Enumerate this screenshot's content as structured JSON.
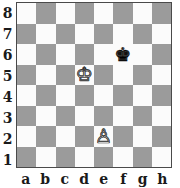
{
  "board": {
    "orientation": "white",
    "light_square_color": "#fbfbfb",
    "dark_square_color": "#9b9b9b",
    "border_color": "#4a4a4a",
    "label_color": "#1a1a1a",
    "files": [
      "a",
      "b",
      "c",
      "d",
      "e",
      "f",
      "g",
      "h"
    ],
    "ranks": [
      "8",
      "7",
      "6",
      "5",
      "4",
      "3",
      "2",
      "1"
    ],
    "squares": [
      [
        {
          "square": "a8",
          "shade": "light",
          "piece": "",
          "piece_name": ""
        },
        {
          "square": "b8",
          "shade": "dark",
          "piece": "",
          "piece_name": ""
        },
        {
          "square": "c8",
          "shade": "light",
          "piece": "",
          "piece_name": ""
        },
        {
          "square": "d8",
          "shade": "dark",
          "piece": "",
          "piece_name": ""
        },
        {
          "square": "e8",
          "shade": "light",
          "piece": "",
          "piece_name": ""
        },
        {
          "square": "f8",
          "shade": "dark",
          "piece": "",
          "piece_name": ""
        },
        {
          "square": "g8",
          "shade": "light",
          "piece": "",
          "piece_name": ""
        },
        {
          "square": "h8",
          "shade": "dark",
          "piece": "",
          "piece_name": ""
        }
      ],
      [
        {
          "square": "a7",
          "shade": "dark",
          "piece": "",
          "piece_name": ""
        },
        {
          "square": "b7",
          "shade": "light",
          "piece": "",
          "piece_name": ""
        },
        {
          "square": "c7",
          "shade": "dark",
          "piece": "",
          "piece_name": ""
        },
        {
          "square": "d7",
          "shade": "light",
          "piece": "",
          "piece_name": ""
        },
        {
          "square": "e7",
          "shade": "dark",
          "piece": "",
          "piece_name": ""
        },
        {
          "square": "f7",
          "shade": "light",
          "piece": "",
          "piece_name": ""
        },
        {
          "square": "g7",
          "shade": "dark",
          "piece": "",
          "piece_name": ""
        },
        {
          "square": "h7",
          "shade": "light",
          "piece": "",
          "piece_name": ""
        }
      ],
      [
        {
          "square": "a6",
          "shade": "light",
          "piece": "",
          "piece_name": ""
        },
        {
          "square": "b6",
          "shade": "dark",
          "piece": "",
          "piece_name": ""
        },
        {
          "square": "c6",
          "shade": "light",
          "piece": "",
          "piece_name": ""
        },
        {
          "square": "d6",
          "shade": "dark",
          "piece": "",
          "piece_name": ""
        },
        {
          "square": "e6",
          "shade": "light",
          "piece": "",
          "piece_name": ""
        },
        {
          "square": "f6",
          "shade": "light",
          "piece": "♚",
          "piece_name": "black-king"
        },
        {
          "square": "g6",
          "shade": "light",
          "piece": "",
          "piece_name": ""
        },
        {
          "square": "h6",
          "shade": "dark",
          "piece": "",
          "piece_name": ""
        }
      ],
      [
        {
          "square": "a5",
          "shade": "dark",
          "piece": "",
          "piece_name": ""
        },
        {
          "square": "b5",
          "shade": "light",
          "piece": "",
          "piece_name": ""
        },
        {
          "square": "c5",
          "shade": "dark",
          "piece": "",
          "piece_name": ""
        },
        {
          "square": "d5",
          "shade": "light",
          "piece": "♔",
          "piece_name": "white-king"
        },
        {
          "square": "e5",
          "shade": "dark",
          "piece": "",
          "piece_name": ""
        },
        {
          "square": "f5",
          "shade": "light",
          "piece": "",
          "piece_name": ""
        },
        {
          "square": "g5",
          "shade": "dark",
          "piece": "",
          "piece_name": ""
        },
        {
          "square": "h5",
          "shade": "light",
          "piece": "",
          "piece_name": ""
        }
      ],
      [
        {
          "square": "a4",
          "shade": "light",
          "piece": "",
          "piece_name": ""
        },
        {
          "square": "b4",
          "shade": "dark",
          "piece": "",
          "piece_name": ""
        },
        {
          "square": "c4",
          "shade": "light",
          "piece": "",
          "piece_name": ""
        },
        {
          "square": "d4",
          "shade": "dark",
          "piece": "",
          "piece_name": ""
        },
        {
          "square": "e4",
          "shade": "light",
          "piece": "",
          "piece_name": ""
        },
        {
          "square": "f4",
          "shade": "dark",
          "piece": "",
          "piece_name": ""
        },
        {
          "square": "g4",
          "shade": "light",
          "piece": "",
          "piece_name": ""
        },
        {
          "square": "h4",
          "shade": "dark",
          "piece": "",
          "piece_name": ""
        }
      ],
      [
        {
          "square": "a3",
          "shade": "dark",
          "piece": "",
          "piece_name": ""
        },
        {
          "square": "b3",
          "shade": "light",
          "piece": "",
          "piece_name": ""
        },
        {
          "square": "c3",
          "shade": "dark",
          "piece": "",
          "piece_name": ""
        },
        {
          "square": "d3",
          "shade": "light",
          "piece": "",
          "piece_name": ""
        },
        {
          "square": "e3",
          "shade": "dark",
          "piece": "",
          "piece_name": ""
        },
        {
          "square": "f3",
          "shade": "light",
          "piece": "",
          "piece_name": ""
        },
        {
          "square": "g3",
          "shade": "dark",
          "piece": "",
          "piece_name": ""
        },
        {
          "square": "h3",
          "shade": "light",
          "piece": "",
          "piece_name": ""
        }
      ],
      [
        {
          "square": "a2",
          "shade": "light",
          "piece": "",
          "piece_name": ""
        },
        {
          "square": "b2",
          "shade": "dark",
          "piece": "",
          "piece_name": ""
        },
        {
          "square": "c2",
          "shade": "light",
          "piece": "",
          "piece_name": ""
        },
        {
          "square": "d2",
          "shade": "dark",
          "piece": "",
          "piece_name": ""
        },
        {
          "square": "e2",
          "shade": "light",
          "piece": "♙",
          "piece_name": "white-pawn"
        },
        {
          "square": "f2",
          "shade": "dark",
          "piece": "",
          "piece_name": ""
        },
        {
          "square": "g2",
          "shade": "light",
          "piece": "",
          "piece_name": ""
        },
        {
          "square": "h2",
          "shade": "dark",
          "piece": "",
          "piece_name": ""
        }
      ],
      [
        {
          "square": "a1",
          "shade": "dark",
          "piece": "",
          "piece_name": ""
        },
        {
          "square": "b1",
          "shade": "light",
          "piece": "",
          "piece_name": ""
        },
        {
          "square": "c1",
          "shade": "dark",
          "piece": "",
          "piece_name": ""
        },
        {
          "square": "d1",
          "shade": "light",
          "piece": "",
          "piece_name": ""
        },
        {
          "square": "e1",
          "shade": "dark",
          "piece": "",
          "piece_name": ""
        },
        {
          "square": "f1",
          "shade": "light",
          "piece": "",
          "piece_name": ""
        },
        {
          "square": "g1",
          "shade": "dark",
          "piece": "",
          "piece_name": ""
        },
        {
          "square": "h1",
          "shade": "light",
          "piece": "",
          "piece_name": ""
        }
      ]
    ],
    "pieces": [
      {
        "square": "f6",
        "piece_name": "black-king",
        "color": "black",
        "glyph": "♚"
      },
      {
        "square": "d5",
        "piece_name": "white-king",
        "color": "white",
        "glyph": "♔"
      },
      {
        "square": "e2",
        "piece_name": "white-pawn",
        "color": "white",
        "glyph": "♙"
      }
    ]
  }
}
